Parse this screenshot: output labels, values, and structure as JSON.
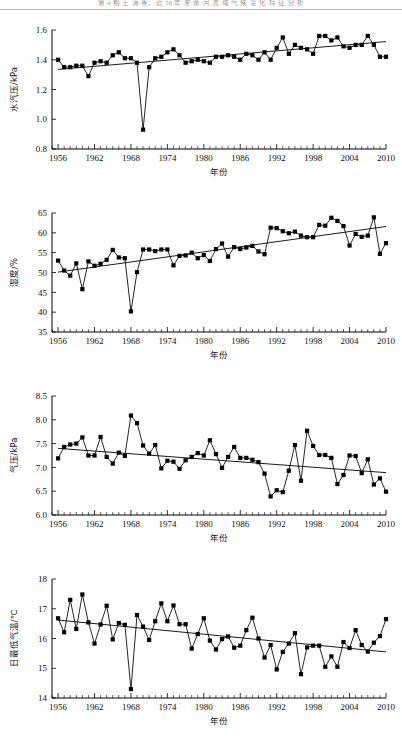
{
  "document": {
    "running_head": "第 4 期          王 涛 等：近 50 年 来 黄 河 流 域 气 候 变 化 特 征 分 析",
    "page_kind": "journal-figure-page"
  },
  "shared": {
    "xlabel": "年份",
    "x_ticks": [
      1956,
      1962,
      1968,
      1974,
      1980,
      1986,
      1992,
      1998,
      2004,
      2010
    ],
    "xlim": [
      1955,
      2010
    ],
    "minor_tick_step": 1,
    "marker": "filled-square",
    "line_color": "#000000",
    "trend_color": "#000000"
  },
  "chart_data": [
    {
      "id": "vapor-pressure",
      "type": "line",
      "title": "",
      "xlabel": "年份",
      "ylabel": "水汽压/kPa",
      "ylim": [
        0.8,
        1.6
      ],
      "y_ticks": [
        0.8,
        1.0,
        1.2,
        1.4,
        1.6
      ],
      "grid": false,
      "legend": "none",
      "x": [
        1956,
        1957,
        1958,
        1959,
        1960,
        1961,
        1962,
        1963,
        1964,
        1965,
        1966,
        1967,
        1968,
        1969,
        1970,
        1971,
        1972,
        1973,
        1974,
        1975,
        1976,
        1977,
        1978,
        1979,
        1980,
        1981,
        1982,
        1983,
        1984,
        1985,
        1986,
        1987,
        1988,
        1989,
        1990,
        1991,
        1992,
        1993,
        1994,
        1995,
        1996,
        1997,
        1998,
        1999,
        2000,
        2001,
        2002,
        2003,
        2004,
        2005,
        2006,
        2007,
        2008,
        2009,
        2010
      ],
      "values": [
        1.4,
        1.35,
        1.35,
        1.36,
        1.36,
        1.29,
        1.38,
        1.39,
        1.38,
        1.43,
        1.45,
        1.41,
        1.41,
        1.38,
        0.93,
        1.35,
        1.41,
        1.42,
        1.45,
        1.47,
        1.43,
        1.38,
        1.39,
        1.4,
        1.39,
        1.38,
        1.42,
        1.42,
        1.43,
        1.42,
        1.4,
        1.44,
        1.43,
        1.4,
        1.45,
        1.4,
        1.48,
        1.55,
        1.44,
        1.5,
        1.48,
        1.47,
        1.44,
        1.56,
        1.56,
        1.53,
        1.55,
        1.49,
        1.48,
        1.5,
        1.5,
        1.56,
        1.5,
        1.42,
        1.42
      ],
      "trend": {
        "x0": 1956,
        "y0": 1.335,
        "x1": 2010,
        "y1": 1.522,
        "direction": "increasing"
      }
    },
    {
      "id": "humidity",
      "type": "line",
      "title": "",
      "xlabel": "年份",
      "ylabel": "湿度/%",
      "ylim": [
        35,
        65
      ],
      "y_ticks": [
        35,
        40,
        45,
        50,
        55,
        60,
        65
      ],
      "grid": false,
      "legend": "none",
      "x": [
        1956,
        1957,
        1958,
        1959,
        1960,
        1961,
        1962,
        1963,
        1964,
        1965,
        1966,
        1967,
        1968,
        1969,
        1970,
        1971,
        1972,
        1973,
        1974,
        1975,
        1976,
        1977,
        1978,
        1979,
        1980,
        1981,
        1982,
        1983,
        1984,
        1985,
        1986,
        1987,
        1988,
        1989,
        1990,
        1991,
        1992,
        1993,
        1994,
        1995,
        1996,
        1997,
        1998,
        1999,
        2000,
        2001,
        2002,
        2003,
        2004,
        2005,
        2006,
        2007,
        2008,
        2009,
        2010
      ],
      "values": [
        53.0,
        50.5,
        49.2,
        52.3,
        45.8,
        52.8,
        51.7,
        52.2,
        53.2,
        55.7,
        53.8,
        53.6,
        40.2,
        50.1,
        55.8,
        55.8,
        55.4,
        55.8,
        55.8,
        51.8,
        54.2,
        54.3,
        55.0,
        53.6,
        54.4,
        52.9,
        55.9,
        57.3,
        54.0,
        56.4,
        55.9,
        56.3,
        56.7,
        55.3,
        54.6,
        61.3,
        61.2,
        60.4,
        59.9,
        60.3,
        59.3,
        58.9,
        58.9,
        62.0,
        61.8,
        63.8,
        63.0,
        61.7,
        56.8,
        59.7,
        59.0,
        59.3,
        63.9,
        54.7,
        57.4
      ],
      "trend": {
        "x0": 1956,
        "y0": 50.1,
        "x1": 2010,
        "y1": 61.6,
        "direction": "increasing"
      }
    },
    {
      "id": "air-pressure",
      "type": "line",
      "title": "",
      "xlabel": "年份",
      "ylabel": "气压/kPa",
      "ylim": [
        6.0,
        8.5
      ],
      "y_ticks": [
        6.0,
        6.5,
        7.0,
        7.5,
        8.0,
        8.5
      ],
      "grid": false,
      "legend": "none",
      "x": [
        1956,
        1957,
        1958,
        1959,
        1960,
        1961,
        1962,
        1963,
        1964,
        1965,
        1966,
        1967,
        1968,
        1969,
        1970,
        1971,
        1972,
        1973,
        1974,
        1975,
        1976,
        1977,
        1978,
        1979,
        1980,
        1981,
        1982,
        1983,
        1984,
        1985,
        1986,
        1987,
        1988,
        1989,
        1990,
        1991,
        1992,
        1993,
        1994,
        1995,
        1996,
        1997,
        1998,
        1999,
        2000,
        2001,
        2002,
        2003,
        2004,
        2005,
        2006,
        2007,
        2008,
        2009,
        2010
      ],
      "values": [
        7.19,
        7.43,
        7.48,
        7.5,
        7.63,
        7.25,
        7.25,
        7.64,
        7.22,
        7.08,
        7.31,
        7.24,
        8.09,
        7.93,
        7.46,
        7.29,
        7.47,
        6.98,
        7.14,
        7.12,
        6.97,
        7.15,
        7.22,
        7.3,
        7.25,
        7.57,
        7.28,
        6.99,
        7.22,
        7.43,
        7.2,
        7.2,
        7.16,
        7.11,
        6.87,
        6.39,
        6.52,
        6.48,
        6.93,
        7.47,
        6.72,
        7.77,
        7.45,
        7.26,
        7.26,
        7.2,
        6.65,
        6.84,
        7.25,
        7.24,
        6.88,
        7.17,
        6.64,
        6.77,
        6.49,
        7.29,
        7.02
      ],
      "trend": {
        "x0": 1956,
        "y0": 7.4,
        "x1": 2010,
        "y1": 6.89,
        "direction": "decreasing"
      }
    },
    {
      "id": "daily-min-temperature",
      "type": "line",
      "title": "",
      "xlabel": "年份",
      "ylabel": "日最低气温/℃",
      "ylim": [
        14,
        18
      ],
      "y_ticks": [
        14,
        15,
        16,
        17,
        18
      ],
      "grid": false,
      "legend": "none",
      "x": [
        1956,
        1957,
        1958,
        1959,
        1960,
        1961,
        1962,
        1963,
        1964,
        1965,
        1966,
        1967,
        1968,
        1969,
        1970,
        1971,
        1972,
        1973,
        1974,
        1975,
        1976,
        1977,
        1978,
        1979,
        1980,
        1981,
        1982,
        1983,
        1984,
        1985,
        1986,
        1987,
        1988,
        1989,
        1990,
        1991,
        1992,
        1993,
        1994,
        1995,
        1996,
        1997,
        1998,
        1999,
        2000,
        2001,
        2002,
        2003,
        2004,
        2005,
        2006,
        2007,
        2008,
        2009,
        2010
      ],
      "values": [
        16.68,
        16.21,
        17.3,
        16.32,
        17.48,
        16.54,
        15.83,
        16.47,
        17.1,
        15.97,
        16.52,
        16.46,
        14.3,
        16.79,
        16.4,
        15.95,
        16.58,
        17.18,
        16.58,
        17.11,
        16.48,
        16.48,
        15.66,
        16.15,
        16.68,
        15.93,
        15.63,
        15.98,
        16.07,
        15.69,
        15.76,
        16.28,
        16.7,
        16.0,
        15.36,
        15.78,
        14.96,
        15.55,
        15.83,
        16.18,
        14.8,
        15.7,
        15.76,
        15.76,
        15.05,
        15.4,
        15.05,
        15.88,
        15.68,
        16.28,
        15.78,
        15.56,
        15.86,
        16.08,
        16.65
      ],
      "trend": {
        "x0": 1956,
        "y0": 16.62,
        "x1": 2010,
        "y1": 15.55,
        "direction": "decreasing"
      }
    }
  ]
}
